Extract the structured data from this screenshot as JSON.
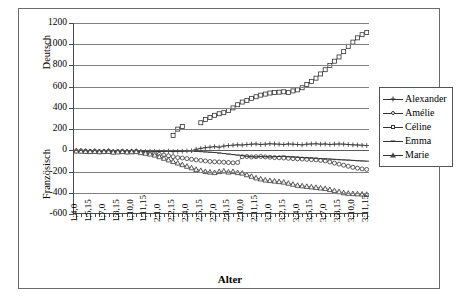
{
  "chart_data": {
    "type": "line",
    "title": "",
    "xlabel": "Alter",
    "ylabel_top": "Deutsch",
    "ylabel_bottom": "Französisch",
    "ylim": [
      -600,
      1200
    ],
    "ytick_values": [
      1200,
      1000,
      800,
      600,
      400,
      200,
      0,
      -200,
      -400,
      -600
    ],
    "ytick_labels": [
      "1200",
      "1000",
      "800",
      "600",
      "400",
      "200",
      "0",
      "-200",
      "-400",
      "-600"
    ],
    "grid": true,
    "legend_position": "right",
    "xtick_labels": [
      "1;4,0",
      "1;5,15",
      "1;7,0",
      "1;8,15",
      "1;10,0",
      "1;11,15",
      "2;1,0",
      "2;2,15",
      "2;4,0",
      "2;5,15",
      "2;7,0",
      "2;8,15",
      "2;10,0",
      "2;11,15",
      "3;1,0",
      "3;2,15",
      "3;4,0",
      "3;5,15",
      "3;7,0",
      "3;8,15",
      "3;10,0",
      "3;11,15"
    ],
    "x": [
      0,
      1,
      2,
      3,
      4,
      5,
      6,
      7,
      8,
      9,
      10,
      11,
      12,
      13,
      14,
      15,
      16,
      17,
      18,
      19,
      20,
      21,
      22,
      23,
      24,
      25,
      26,
      27,
      28,
      29,
      30,
      31,
      32,
      33,
      34,
      35,
      36,
      37,
      38,
      39,
      40,
      41,
      42,
      43,
      44,
      45,
      46,
      47,
      48,
      49,
      50,
      51,
      52,
      53,
      54,
      55,
      56,
      57,
      58,
      59,
      60,
      61,
      62,
      63
    ],
    "series": [
      {
        "name": "Alexander",
        "marker": "plus",
        "values": [
          -5,
          -5,
          -8,
          -8,
          -6,
          -10,
          -8,
          -5,
          -12,
          -10,
          -8,
          -10,
          -8,
          -6,
          -10,
          -12,
          -8,
          -10,
          -12,
          -10,
          -8,
          -12,
          -10,
          -8,
          -6,
          -4,
          10,
          18,
          25,
          30,
          35,
          30,
          40,
          45,
          48,
          52,
          50,
          55,
          58,
          60,
          55,
          58,
          62,
          60,
          58,
          55,
          60,
          58,
          55,
          52,
          58,
          60,
          62,
          58,
          60,
          55,
          58,
          60,
          58,
          55,
          52,
          50,
          48,
          45
        ]
      },
      {
        "name": "Amélie",
        "marker": "circle",
        "values": [
          -5,
          -6,
          -8,
          -10,
          -8,
          -12,
          -10,
          -8,
          -15,
          -12,
          -10,
          -14,
          -12,
          -10,
          -18,
          -20,
          -25,
          -30,
          -38,
          -45,
          -52,
          -60,
          -68,
          -72,
          -78,
          -85,
          -90,
          -95,
          -100,
          -105,
          -108,
          -110,
          -112,
          -115,
          -118,
          -115,
          -60,
          -58,
          -62,
          -60,
          -58,
          -62,
          -65,
          -68,
          -70,
          -72,
          -75,
          -78,
          -80,
          -82,
          -85,
          -88,
          -90,
          -95,
          -100,
          -110,
          -120,
          -130,
          -140,
          -150,
          -160,
          -168,
          -175,
          -180
        ]
      },
      {
        "name": "Céline",
        "marker": "square",
        "values": [
          null,
          null,
          null,
          null,
          null,
          null,
          null,
          null,
          null,
          null,
          null,
          null,
          null,
          null,
          null,
          null,
          null,
          null,
          null,
          null,
          null,
          140,
          200,
          225,
          null,
          null,
          null,
          260,
          290,
          310,
          330,
          345,
          355,
          375,
          400,
          430,
          455,
          470,
          490,
          505,
          520,
          530,
          540,
          545,
          548,
          552,
          545,
          560,
          570,
          590,
          620,
          650,
          680,
          720,
          760,
          800,
          840,
          880,
          930,
          980,
          1020,
          1060,
          1090,
          1110
        ]
      },
      {
        "name": "Emma",
        "marker": "dash",
        "values": [
          -4,
          -5,
          -6,
          -6,
          -5,
          -8,
          -6,
          -5,
          -10,
          -8,
          -6,
          -8,
          -6,
          -5,
          -8,
          -10,
          -6,
          -8,
          -10,
          -8,
          -6,
          -10,
          -8,
          -6,
          -5,
          -5,
          -10,
          -12,
          -15,
          -18,
          -20,
          -25,
          -30,
          -35,
          -40,
          -45,
          -50,
          -55,
          -60,
          -62,
          -58,
          -60,
          -62,
          -60,
          -58,
          -55,
          -60,
          -62,
          -65,
          -68,
          -70,
          -72,
          -75,
          -78,
          -80,
          -82,
          -85,
          -88,
          -90,
          -92,
          -95,
          -98,
          -100,
          -102
        ]
      },
      {
        "name": "Marie",
        "marker": "triangle",
        "values": [
          -6,
          -8,
          -10,
          -12,
          -10,
          -14,
          -12,
          -10,
          -18,
          -15,
          -12,
          -16,
          -14,
          -12,
          -22,
          -28,
          -35,
          -45,
          -60,
          -75,
          -90,
          -105,
          -120,
          -135,
          -150,
          -165,
          -180,
          -190,
          -200,
          -205,
          -210,
          -200,
          -195,
          -205,
          -200,
          -210,
          -215,
          -230,
          -245,
          -260,
          -270,
          -280,
          -285,
          -290,
          -295,
          -300,
          -310,
          -320,
          -330,
          -335,
          -340,
          -345,
          -350,
          -355,
          -360,
          -370,
          -380,
          -390,
          -400,
          -405,
          -408,
          -410,
          -412,
          -415
        ]
      }
    ]
  },
  "legend": {
    "items": [
      {
        "label": "Alexander",
        "marker": "plus"
      },
      {
        "label": "Amélie",
        "marker": "circle"
      },
      {
        "label": "Céline",
        "marker": "square"
      },
      {
        "label": "Emma",
        "marker": "dash"
      },
      {
        "label": "Marie",
        "marker": "triangle"
      }
    ]
  }
}
